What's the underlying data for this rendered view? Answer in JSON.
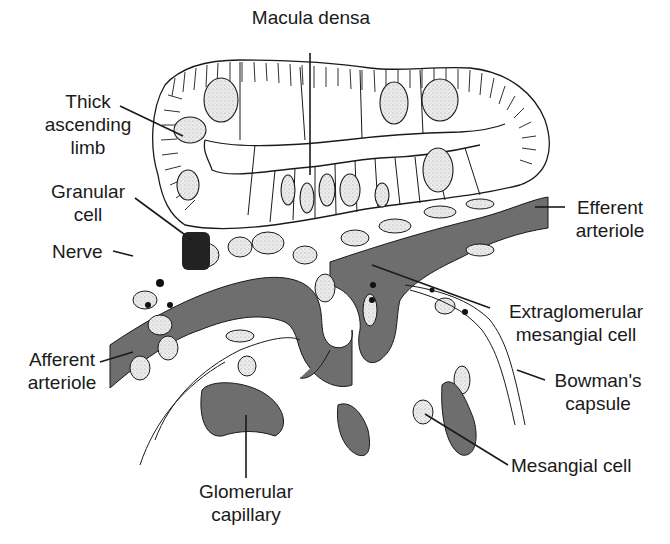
{
  "diagram": {
    "colors": {
      "ink": "#1a1a1a",
      "vessel_fill": "#6e6e6e",
      "nucleus_fill": "#e2e2e2",
      "background": "#ffffff"
    },
    "labels": {
      "macula_densa": {
        "line1": "Macula densa"
      },
      "thick_ascending_limb": {
        "line1": "Thick",
        "line2": "ascending",
        "line3": "limb"
      },
      "granular_cell": {
        "line1": "Granular",
        "line2": "cell"
      },
      "nerve": {
        "line1": "Nerve"
      },
      "efferent_arteriole": {
        "line1": "Efferent",
        "line2": "arteriole"
      },
      "extraglomerular_mesangial_cell": {
        "line1": "Extraglomerular",
        "line2": "mesangial cell"
      },
      "afferent_arteriole": {
        "line1": "Afferent",
        "line2": "arteriole"
      },
      "bowmans_capsule": {
        "line1": "Bowman's",
        "line2": "capsule"
      },
      "mesangial_cell": {
        "line1": "Mesangial cell"
      },
      "glomerular_capillary": {
        "line1": "Glomerular",
        "line2": "capillary"
      }
    }
  }
}
